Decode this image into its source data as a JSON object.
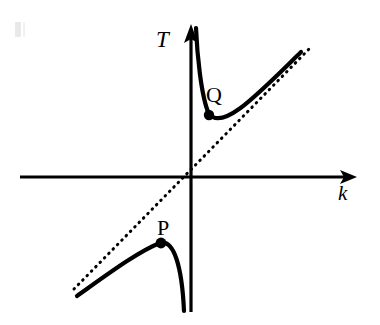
{
  "figure": {
    "background_color": "#ffffff",
    "stroke_color": "#000000",
    "width": 380,
    "height": 325
  },
  "axes": {
    "vertical": {
      "label": "T",
      "name": "T-axis",
      "x": 191,
      "y_top": 25,
      "y_bottom": 312,
      "arrow": "up"
    },
    "horizontal": {
      "label": "k",
      "name": "k-axis",
      "y": 177,
      "x_left": 20,
      "x_right": 357,
      "arrow": "right"
    }
  },
  "asymptote": {
    "name": "dotted-asymptote-line",
    "style": "dotted",
    "x1": 74,
    "y1": 289,
    "x2": 311,
    "y2": 47
  },
  "curves": [
    {
      "id": "curve-Q",
      "label": "Q",
      "quadrant": "upper-right",
      "path": "M 196,28 C 197,52 202,96 209,114 C 222,130 256,96 301,52",
      "point": {
        "label": "Q",
        "x": 209,
        "y": 115,
        "radius": 5
      },
      "label_position": {
        "x": 206,
        "y": 84
      }
    },
    {
      "id": "curve-P",
      "label": "P",
      "quadrant": "lower-left",
      "path": "M 77,296 C 110,272 140,250 161,243 C 174,240 182,268 184,311",
      "point": {
        "label": "P",
        "x": 161,
        "y": 243,
        "radius": 5
      },
      "label_position": {
        "x": 157,
        "y": 217
      }
    }
  ],
  "labels": {
    "T": "T",
    "k": "k",
    "P": "P",
    "Q": "Q"
  },
  "colors": {
    "ink": "#000000",
    "paper": "#ffffff",
    "speck": "#e9e9e9"
  }
}
